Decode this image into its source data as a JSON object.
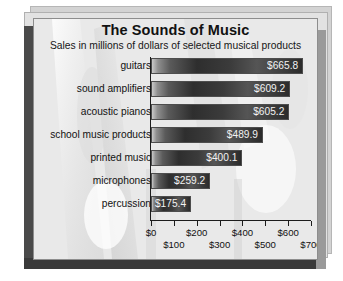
{
  "chart_data": {
    "type": "bar",
    "orientation": "horizontal",
    "title": "The Sounds of Music",
    "subtitle": "Sales in millions of dollars of selected musical products",
    "xlabel": "",
    "ylabel": "",
    "xlim": [
      0,
      700
    ],
    "xticks": [
      0,
      100,
      200,
      300,
      400,
      500,
      600,
      700
    ],
    "xtick_labels": [
      "$0",
      "$100",
      "$200",
      "$300",
      "$400",
      "$500",
      "$600",
      "$700"
    ],
    "grid": false,
    "legend": null,
    "value_prefix": "$",
    "categories": [
      "guitars",
      "sound amplifiers",
      "acoustic pianos",
      "school music products",
      "printed music",
      "microphones",
      "percussion"
    ],
    "values": [
      665.8,
      609.2,
      605.2,
      489.9,
      400.1,
      259.2,
      175.4
    ],
    "data_labels": [
      "$665.8",
      "$609.2",
      "$605.2",
      "$489.9",
      "$400.1",
      "$259.2",
      "$175.4"
    ],
    "colors": {
      "bar_light": "#c9c9c9",
      "bar_dark": "#2e2e2e",
      "bar_border": "#4d4d4d",
      "panel_background": "#e9e9e9",
      "axis": "#1c1c1c",
      "value_text": "#f2f2f2",
      "title_text": "#111111"
    }
  },
  "bars": [
    {
      "label": "guitars",
      "value": 665.8,
      "display": "$665.8"
    },
    {
      "label": "sound amplifiers",
      "value": 609.2,
      "display": "$609.2"
    },
    {
      "label": "acoustic pianos",
      "value": 605.2,
      "display": "$605.2"
    },
    {
      "label": "school music products",
      "value": 489.9,
      "display": "$489.9"
    },
    {
      "label": "printed music",
      "value": 400.1,
      "display": "$400.1"
    },
    {
      "label": "microphones",
      "value": 259.2,
      "display": "$259.2"
    },
    {
      "label": "percussion",
      "value": 175.4,
      "display": "$175.4"
    }
  ],
  "axis": {
    "ticks": [
      {
        "value": 0,
        "label": "$0",
        "row": "a"
      },
      {
        "value": 100,
        "label": "$100",
        "row": "b"
      },
      {
        "value": 200,
        "label": "$200",
        "row": "a"
      },
      {
        "value": 300,
        "label": "$300",
        "row": "b"
      },
      {
        "value": 400,
        "label": "$400",
        "row": "a"
      },
      {
        "value": 500,
        "label": "$500",
        "row": "b"
      },
      {
        "value": 600,
        "label": "$600",
        "row": "a"
      },
      {
        "value": 700,
        "label": "$700",
        "row": "b"
      }
    ]
  }
}
